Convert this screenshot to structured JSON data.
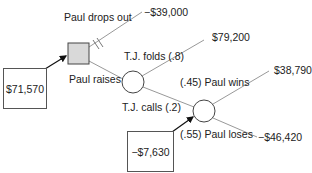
{
  "diagram": {
    "type": "decision-tree",
    "decision_node": {
      "label": "Paul's decision",
      "fill": "#d9d9d9"
    },
    "branches": {
      "drop_out": {
        "label": "Paul drops out",
        "payoff": "−$39,000",
        "blocked": true
      },
      "raise": {
        "label": "Paul raises"
      },
      "tj_folds": {
        "label": "T.J. folds (.8)",
        "payoff": "$79,200"
      },
      "tj_calls": {
        "label": "T.J. calls (.2)"
      },
      "paul_wins": {
        "label": "(.45) Paul wins",
        "payoff": "$38,790"
      },
      "paul_loses": {
        "label": "(.55) Paul loses",
        "payoff": "−$46,420"
      }
    },
    "expected_values": {
      "decision": "$71,570",
      "showdown": "−$7,630"
    },
    "colors": {
      "line": "#999999",
      "node_stroke": "#444444",
      "arrow": "#111111"
    }
  }
}
